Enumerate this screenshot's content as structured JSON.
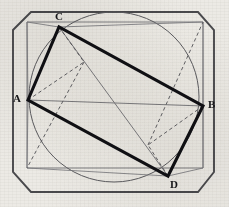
{
  "figure": {
    "background_color": "#eceae5",
    "labels": [
      {
        "name": "A",
        "text": "A",
        "x": 14,
        "y": 94,
        "vertex_x": 28,
        "vertex_y": 100
      },
      {
        "name": "B",
        "text": "B",
        "x": 208,
        "y": 100,
        "vertex_x": 203,
        "vertex_y": 106
      },
      {
        "name": "C",
        "text": "C",
        "x": 55,
        "y": 12,
        "vertex_x": 59,
        "vertex_y": 27
      },
      {
        "name": "D",
        "text": "D",
        "x": 170,
        "y": 179,
        "vertex_x": 168,
        "vertex_y": 176
      }
    ],
    "colors": {
      "outer_octagon": "#4a4a4d",
      "inner_square": "#6f6f72",
      "circle": "#5c5c60",
      "bold_quad": "#101014",
      "diagonal": "#76767a",
      "dashed": "#5a5a5e",
      "label_text": "#17171a"
    },
    "strokes": {
      "outer_octagon_width": 1.9,
      "inner_square_width": 0.9,
      "circle_width": 1.0,
      "bold_quad_width": 3.1,
      "diagonal_width": 0.9,
      "dashed_width": 0.9,
      "dash_pattern": "3.5 2.8"
    },
    "shapes": {
      "outer_octagon": {
        "name": "chamfered-square",
        "points": "31,12 198,12 214,30 214,172 198,192 31,192 13,172 13,30"
      },
      "inner_square": {
        "name": "inner-square",
        "points": "27,22 203,22 203,168 27,168"
      },
      "circle": {
        "name": "circumscribed-circle",
        "cx": 114,
        "cy": 97,
        "r": 85
      },
      "bold_quad": {
        "name": "rectangle-ACBD",
        "points": "28,100 59,27 203,106 168,176"
      },
      "diagonals": [
        {
          "name": "diagonal-A-B",
          "x1": 28,
          "y1": 100,
          "x2": 203,
          "y2": 106
        },
        {
          "name": "diagonal-C-D",
          "x1": 59,
          "y1": 27,
          "x2": 168,
          "y2": 176
        }
      ],
      "dashed_segments": [
        {
          "name": "dashed-A-to-P1",
          "x1": 28,
          "y1": 100,
          "x2": 84,
          "y2": 62
        },
        {
          "name": "dashed-C-to-P1",
          "x1": 59,
          "y1": 27,
          "x2": 84,
          "y2": 62
        },
        {
          "name": "dashed-P1-to-corner-bl",
          "x1": 84,
          "y1": 62,
          "x2": 27,
          "y2": 168
        },
        {
          "name": "dashed-B-to-P2",
          "x1": 203,
          "y1": 106,
          "x2": 148,
          "y2": 145
        },
        {
          "name": "dashed-D-to-P2",
          "x1": 168,
          "y1": 176,
          "x2": 148,
          "y2": 145
        },
        {
          "name": "dashed-P2-to-corner-tr",
          "x1": 148,
          "y1": 145,
          "x2": 203,
          "y2": 22
        }
      ],
      "thin_connectors": [
        {
          "name": "connector-C-to-corner-tl",
          "x1": 59,
          "y1": 27,
          "x2": 27,
          "y2": 22
        },
        {
          "name": "connector-C-to-corner-tr",
          "x1": 59,
          "y1": 27,
          "x2": 203,
          "y2": 22
        },
        {
          "name": "connector-D-to-corner-bl",
          "x1": 168,
          "y1": 176,
          "x2": 27,
          "y2": 168
        },
        {
          "name": "connector-D-to-corner-br",
          "x1": 168,
          "y1": 176,
          "x2": 203,
          "y2": 168
        },
        {
          "name": "connector-A-to-corner-tl",
          "x1": 28,
          "y1": 100,
          "x2": 27,
          "y2": 22
        },
        {
          "name": "connector-A-to-corner-bl",
          "x1": 28,
          "y1": 100,
          "x2": 27,
          "y2": 168
        },
        {
          "name": "connector-B-to-corner-tr",
          "x1": 203,
          "y1": 106,
          "x2": 203,
          "y2": 22
        },
        {
          "name": "connector-B-to-corner-br",
          "x1": 203,
          "y1": 106,
          "x2": 203,
          "y2": 168
        }
      ]
    }
  }
}
